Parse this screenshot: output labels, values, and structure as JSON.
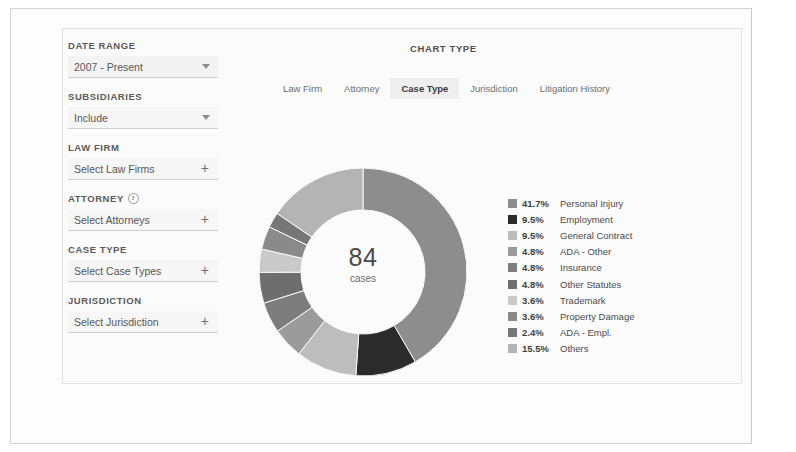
{
  "sidebar": {
    "fields": [
      {
        "label": "DATE RANGE",
        "value": "2007 - Present",
        "control": "caret",
        "name": "date-range",
        "info": false
      },
      {
        "label": "SUBSIDIARIES",
        "value": "Include",
        "control": "caret",
        "name": "subsidiaries",
        "info": false
      },
      {
        "label": "LAW FIRM",
        "value": "Select Law Firms",
        "control": "plus",
        "name": "law-firm",
        "info": false
      },
      {
        "label": "ATTORNEY",
        "value": "Select Attorneys",
        "control": "plus",
        "name": "attorney",
        "info": true
      },
      {
        "label": "CASE TYPE",
        "value": "Select Case Types",
        "control": "plus",
        "name": "case-type",
        "info": false
      },
      {
        "label": "JURISDICTION",
        "value": "Select Jurisdiction",
        "control": "plus",
        "name": "jurisdiction",
        "info": false
      }
    ],
    "info_glyph": "i",
    "plus_glyph": "+"
  },
  "header": {
    "chart_type_title": "CHART TYPE",
    "tabs": [
      {
        "label": "Law Firm",
        "active": false
      },
      {
        "label": "Attorney",
        "active": false
      },
      {
        "label": "Case Type",
        "active": true
      },
      {
        "label": "Jurisdiction",
        "active": false
      },
      {
        "label": "Litigation History",
        "active": false
      }
    ]
  },
  "donut": {
    "center_value": "84",
    "center_label": "cases"
  },
  "chart_data": {
    "type": "pie",
    "title": "Case Type",
    "variant": "donut",
    "total_label": "84 cases",
    "total": 84,
    "units": "cases",
    "legend_position": "right",
    "categories": [
      "Personal Injury",
      "Employment",
      "General Contract",
      "ADA - Other",
      "Insurance",
      "Other Statutes",
      "Trademark",
      "Property Damage",
      "ADA - Empl.",
      "Others"
    ],
    "values": [
      41.7,
      9.5,
      9.5,
      4.8,
      4.8,
      4.8,
      3.6,
      3.6,
      2.4,
      15.5
    ],
    "value_labels": [
      "41.7%",
      "9.5%",
      "9.5%",
      "4.8%",
      "4.8%",
      "4.8%",
      "3.6%",
      "3.6%",
      "2.4%",
      "15.5%"
    ],
    "colors": [
      "#8d8d8d",
      "#2b2b2b",
      "#bdbdbd",
      "#9b9b9b",
      "#7d7d7d",
      "#6e6e6e",
      "#c9c9c9",
      "#8a8a8a",
      "#777777",
      "#b4b4b4"
    ],
    "start_angle_deg": 0,
    "direction": "clockwise"
  }
}
